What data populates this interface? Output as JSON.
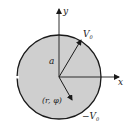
{
  "diagram": {
    "type": "disk-velocity-sketch",
    "colors": {
      "disk_fill": "#cfcfcf",
      "stroke": "#1a1a1a",
      "background": "#ffffff"
    },
    "labels": {
      "y_axis": "y",
      "x_axis": "x",
      "radius": "a",
      "velocity_top": "V",
      "velocity_top_sub": "0",
      "velocity_bottom": "−V",
      "velocity_bottom_sub": "0",
      "point": "(r, φ)"
    }
  }
}
